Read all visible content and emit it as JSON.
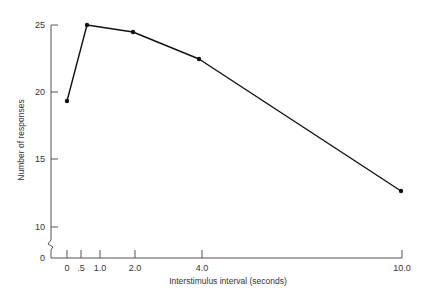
{
  "chart_data": {
    "type": "line",
    "title": "",
    "xlabel": "Interstimulus interval (seconds)",
    "ylabel": "Number of responses",
    "x": [
      0,
      0.7,
      2.0,
      4.0,
      10.0
    ],
    "series": [
      {
        "name": "Responses",
        "values": [
          19.3,
          25.0,
          24.5,
          22.5,
          12.6
        ]
      }
    ],
    "x_ticks": [
      "0",
      ".5",
      "1.0",
      "2.0",
      "4.0",
      "10.0"
    ],
    "y_ticks": [
      "0",
      "10",
      "15",
      "20",
      "25"
    ],
    "ylim": [
      0,
      25
    ],
    "xlim": [
      0,
      10
    ],
    "y_axis_break": true,
    "grid": false,
    "legend": null,
    "colors": {
      "line": "#111111",
      "axis": "#555555",
      "text": "#333333"
    }
  },
  "layout": {
    "y_tick_px": {
      "25": 25,
      "20": 92,
      "15": 159,
      "10": 227,
      "0": 258
    },
    "x_tick_px": {
      "0": 67,
      ".5": 81,
      "1.0": 100,
      "2.0": 135,
      "4.0": 202,
      "10.0": 402
    },
    "points_px": [
      [
        67,
        101
      ],
      [
        87,
        25
      ],
      [
        133,
        32
      ],
      [
        199,
        59
      ],
      [
        401,
        191
      ]
    ]
  }
}
